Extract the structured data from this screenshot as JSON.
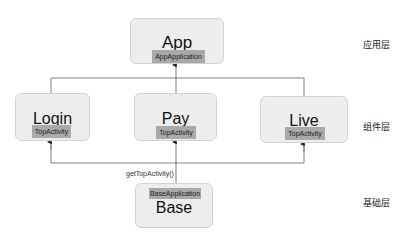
{
  "diagram": {
    "nodes": {
      "app": {
        "title": "App",
        "tag": "AppApplication"
      },
      "login": {
        "title": "Login",
        "tag": "TopActivity"
      },
      "pay": {
        "title": "Pay",
        "tag": "TopActivity"
      },
      "live": {
        "title": "Live",
        "tag": "TopActivity"
      },
      "base": {
        "title": "Base",
        "tag": "BaseApplication"
      }
    },
    "edge_label": "getTopActivity()",
    "layers": {
      "application": "应用层",
      "component": "组件层",
      "base": "基础层"
    },
    "colors": {
      "box_fill": "#ededed",
      "box_border": "#d2d2d2",
      "tag_fill": "#a9a9a9",
      "line": "#555555"
    }
  }
}
